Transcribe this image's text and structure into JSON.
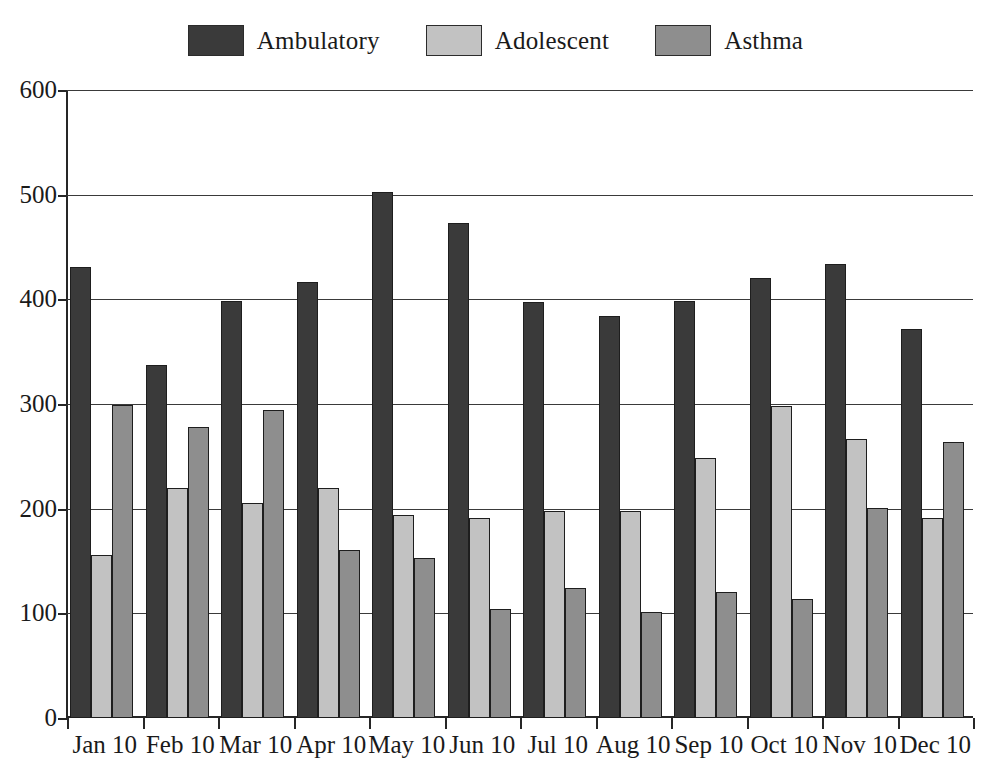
{
  "chart_data": {
    "type": "bar",
    "title": "",
    "subtitle": "",
    "xlabel": "",
    "ylabel": "",
    "ylim": [
      0,
      600
    ],
    "ytick_step": 100,
    "yticks": [
      "0",
      "100",
      "200",
      "300",
      "400",
      "500",
      "600"
    ],
    "grid": "horizontal",
    "legend_position": "top-center",
    "categories": [
      "Jan 10",
      "Feb 10",
      "Mar 10",
      "Apr 10",
      "May 10",
      "Jun 10",
      "Jul 10",
      "Aug 10",
      "Sep 10",
      "Oct 10",
      "Nov 10",
      "Dec 10"
    ],
    "series": [
      {
        "name": "Ambulatory",
        "color": "#3a3a3a",
        "values": [
          431,
          337,
          398,
          417,
          503,
          473,
          397,
          384,
          398,
          420,
          434,
          372
        ]
      },
      {
        "name": "Adolescent",
        "color": "#c2c2c2",
        "values": [
          156,
          220,
          205,
          220,
          194,
          191,
          198,
          198,
          248,
          298,
          267,
          191
        ]
      },
      {
        "name": "Asthma",
        "color": "#8e8e8e",
        "values": [
          299,
          278,
          294,
          161,
          153,
          104,
          124,
          101,
          120,
          114,
          201,
          264
        ]
      }
    ]
  },
  "legend": {
    "items": [
      {
        "label": "Ambulatory",
        "color": "#3a3a3a"
      },
      {
        "label": "Adolescent",
        "color": "#c2c2c2"
      },
      {
        "label": "Asthma",
        "color": "#8e8e8e"
      }
    ]
  }
}
